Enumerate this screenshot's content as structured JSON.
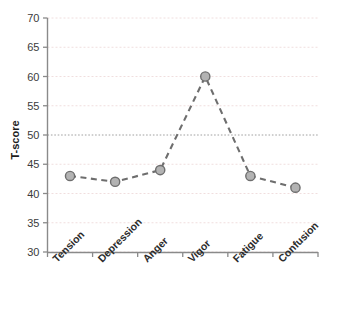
{
  "chart_data": {
    "type": "line",
    "title": "",
    "subtitle": "",
    "xlabel": "",
    "ylabel": "T-score",
    "categories": [
      "Tension",
      "Depression",
      "Anger",
      "Vigor",
      "Fatigue",
      "Confusion"
    ],
    "values": [
      43,
      42,
      44,
      60,
      43,
      41
    ],
    "series": [
      {
        "name": "T-score profile",
        "values": [
          43,
          42,
          44,
          60,
          43,
          41
        ]
      }
    ],
    "ylim": [
      30,
      70
    ],
    "y_ticks": [
      30,
      35,
      40,
      45,
      50,
      55,
      60,
      65,
      70
    ],
    "y_tick_labels": [
      "30",
      "35",
      "40",
      "45",
      "50",
      "55",
      "60",
      "65",
      "70"
    ],
    "grid": true,
    "grid_style": "dotted",
    "legend": "none",
    "legend_position": "none",
    "reference_line": 50,
    "annotations": [],
    "x_tick_label_rotation": -45,
    "line_style": "dashed",
    "marker": "circle",
    "colors": {
      "line": "#6e6e6e",
      "marker_fill": "#b3b3b3",
      "marker_stroke": "#6e6e6e",
      "grid": "#f0dede",
      "reference_line": "#a0a0a0",
      "axis": "#888888",
      "tick_text": "#3b3b3b",
      "label_text": "#2b2b2b",
      "background": "#ffffff"
    }
  }
}
